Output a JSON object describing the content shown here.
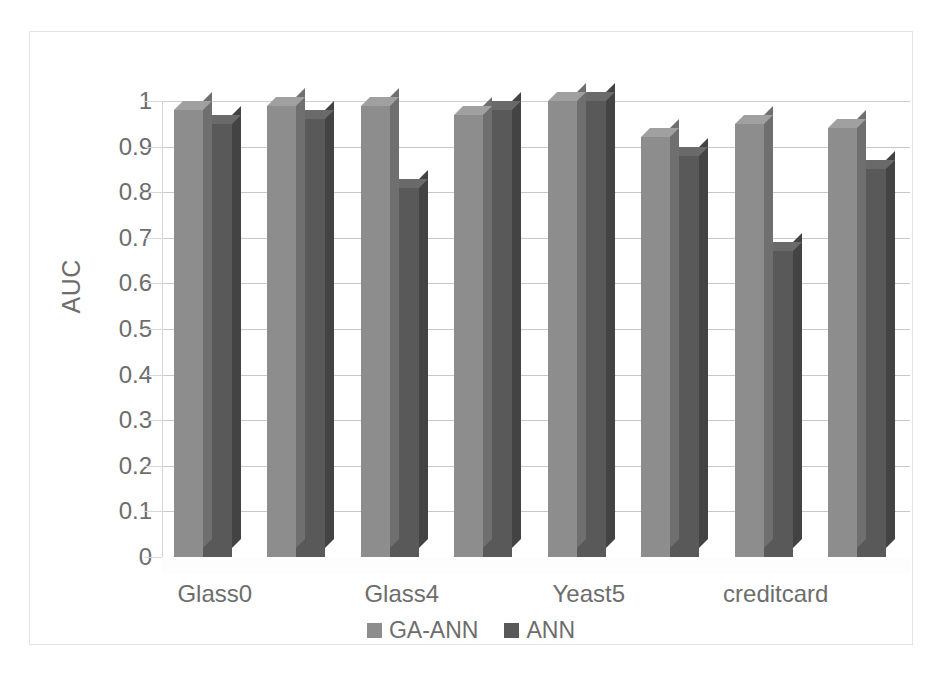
{
  "chart_data": {
    "type": "bar",
    "title": "",
    "subtitle": "",
    "xlabel": "",
    "ylabel": "AUC",
    "ylim": [
      0,
      1
    ],
    "ytick_labels": [
      "1",
      "0.9",
      "0.8",
      "0.7",
      "0.6",
      "0.5",
      "0.4",
      "0.3",
      "0.2",
      "0.1",
      "0"
    ],
    "ytick_values": [
      1,
      0.9,
      0.8,
      0.7,
      0.6,
      0.5,
      0.4,
      0.3,
      0.2,
      0.1,
      0
    ],
    "grid": true,
    "legend_position": "bottom",
    "style": "3d-clustered-column",
    "group_count": 8,
    "categories": [
      "Glass0",
      "",
      "Glass4",
      "",
      "Yeast5",
      "",
      "creditcard",
      ""
    ],
    "visible_tick_labels": [
      {
        "index": 0,
        "label": "Glass0"
      },
      {
        "index": 2,
        "label": "Glass4"
      },
      {
        "index": 4,
        "label": "Yeast5"
      },
      {
        "index": 6,
        "label": "creditcard"
      }
    ],
    "series": [
      {
        "name": "GA-ANN",
        "color": "#8d8d8d",
        "values": [
          0.98,
          0.99,
          0.99,
          0.97,
          1.0,
          0.92,
          0.95,
          0.94
        ]
      },
      {
        "name": "ANN",
        "color": "#595959",
        "values": [
          0.95,
          0.96,
          0.81,
          0.98,
          1.0,
          0.88,
          0.67,
          0.85
        ]
      }
    ]
  },
  "legend": {
    "items": [
      {
        "label": "GA-ANN",
        "color": "#8d8d8d"
      },
      {
        "label": "ANN",
        "color": "#595959"
      }
    ]
  },
  "axis": {
    "y_title": "AUC"
  },
  "colors": {
    "series_ga_ann": "#8d8d8d",
    "series_ann": "#595959",
    "gridline": "#c8c8cc",
    "text": "#6d6d6d",
    "frame": "#e3e3e6",
    "background": "#ffffff"
  }
}
